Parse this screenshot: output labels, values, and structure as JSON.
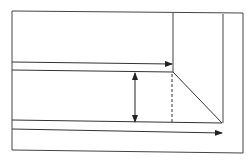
{
  "diagram": {
    "width": 252,
    "height": 163,
    "background": "#ffffff",
    "stroke_color": "#333333",
    "outer_frame": {
      "x1": 12,
      "y1": 11,
      "x2": 243,
      "y2": 153
    },
    "upper_block_right_edge": {
      "x1": 173,
      "y1": 13,
      "x2": 173,
      "y2": 72
    },
    "inner_right_vertical": {
      "x1": 223,
      "y1": 14,
      "x2": 223,
      "y2": 123
    },
    "upper_flow_arrow": {
      "x1": 12,
      "y1": 62,
      "x2": 172,
      "y2": 64
    },
    "mid_horizontal_line": {
      "x1": 12,
      "y1": 70,
      "x2": 173,
      "y2": 72
    },
    "diagonal_line": {
      "x1": 173,
      "y1": 72,
      "x2": 222,
      "y2": 123
    },
    "dashed_vertical": {
      "x1": 172,
      "y1": 74,
      "x2": 172,
      "y2": 123
    },
    "dimension_arrow": {
      "x1": 135,
      "y1": 73,
      "x2": 135,
      "y2": 122
    },
    "lower_horizontal_line": {
      "x1": 12,
      "y1": 120,
      "x2": 222,
      "y2": 123
    },
    "lower_flow_arrow": {
      "x1": 12,
      "y1": 129,
      "x2": 222,
      "y2": 133
    }
  }
}
